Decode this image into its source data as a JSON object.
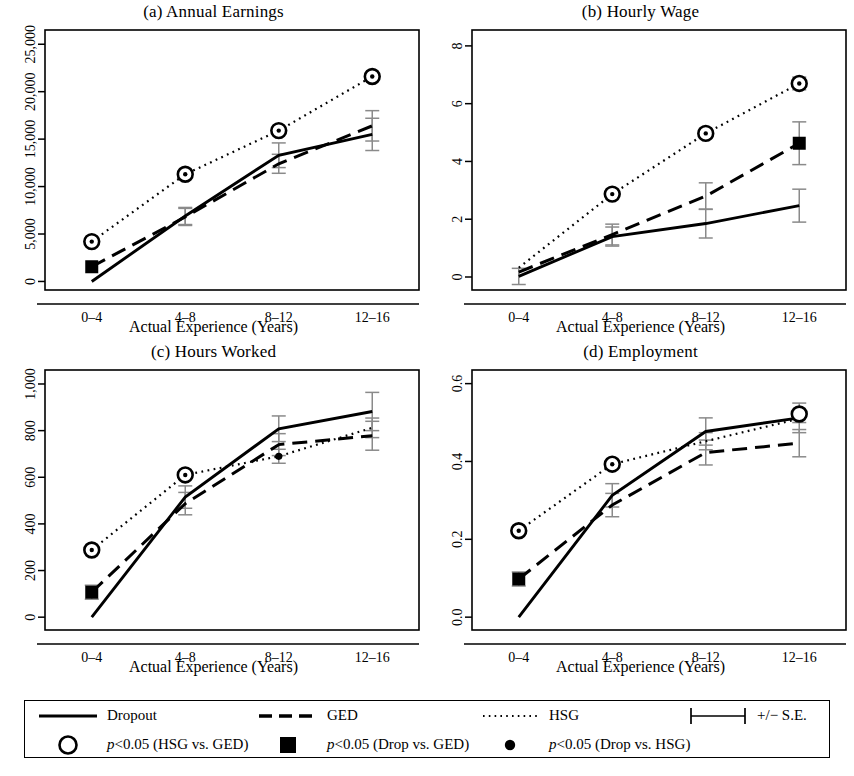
{
  "figure": {
    "xlabel": "Actual Experience (Years)",
    "categories": [
      "0–4",
      "4–8",
      "8–12",
      "12–16"
    ]
  },
  "legend": {
    "dropout_label": "Dropout",
    "ged_label": "GED",
    "hsg_label": "HSG",
    "se_label": "+/− S.E.",
    "p_hsg_ged_label": "<0.05 (HSG vs. GED)",
    "p_drop_ged_label": "<0.05 (Drop vs. GED)",
    "p_drop_hsg_label": "<0.05 (Drop vs. HSG)",
    "p_italic": "p",
    "sym_dropout": "solid-line-icon",
    "sym_ged": "dashed-line-icon",
    "sym_hsg": "dotted-line-icon",
    "sym_se": "error-bar-icon",
    "sym_open_circle": "open-circle-icon",
    "sym_filled_square": "filled-square-icon",
    "sym_small_dot": "small-dot-icon"
  },
  "chart_data": [
    {
      "id": "a",
      "type": "line",
      "title": "(a) Annual Earnings",
      "xlabel": "Actual Experience (Years)",
      "ylabel": "",
      "categories": [
        "0–4",
        "4–8",
        "8–12",
        "12–16"
      ],
      "yticks": [
        0,
        5000,
        10000,
        15000,
        20000,
        25000
      ],
      "ytick_labels": [
        "0",
        "5,000",
        "10,000",
        "15,000",
        "20,000",
        "25,000"
      ],
      "ylim": [
        -900,
        26500
      ],
      "grid": false,
      "series": [
        {
          "name": "Dropout",
          "style": "solid",
          "values": [
            0,
            6900,
            13300,
            15500
          ],
          "errors": [
            0,
            900,
            1300,
            1700
          ]
        },
        {
          "name": "GED",
          "style": "dashed",
          "values": [
            1550,
            6800,
            12400,
            16400
          ],
          "errors": [
            0,
            900,
            1000,
            1600
          ]
        },
        {
          "name": "HSG",
          "style": "dotted",
          "values": [
            4200,
            11300,
            15900,
            21600
          ],
          "errors": [
            0,
            0,
            0,
            0
          ]
        }
      ],
      "markers": [
        {
          "category": "0–4",
          "value": 4200,
          "symbol": "circle-dot",
          "meaning": "p<0.05 (HSG vs. GED)"
        },
        {
          "category": "4–8",
          "value": 11300,
          "symbol": "circle-dot",
          "meaning": "p<0.05 (HSG vs. GED)"
        },
        {
          "category": "8–12",
          "value": 15900,
          "symbol": "circle-dot",
          "meaning": "p<0.05 (HSG vs. GED)"
        },
        {
          "category": "12–16",
          "value": 21600,
          "symbol": "circle-dot",
          "meaning": "p<0.05 (HSG vs. GED)"
        },
        {
          "category": "0–4",
          "value": 1550,
          "symbol": "filled-square",
          "meaning": "p<0.05 (Drop vs. GED)"
        }
      ]
    },
    {
      "id": "b",
      "type": "line",
      "title": "(b) Hourly Wage",
      "xlabel": "Actual Experience (Years)",
      "ylabel": "",
      "categories": [
        "0–4",
        "4–8",
        "8–12",
        "12–16"
      ],
      "yticks": [
        0,
        2,
        4,
        6,
        8
      ],
      "ytick_labels": [
        "0",
        "2",
        "4",
        "6",
        "8"
      ],
      "ylim": [
        -0.45,
        8.55
      ],
      "grid": false,
      "series": [
        {
          "name": "Dropout",
          "style": "solid",
          "values": [
            0.02,
            1.4,
            1.85,
            2.47
          ],
          "errors": [
            0.28,
            0.33,
            0.5,
            0.57
          ]
        },
        {
          "name": "GED",
          "style": "dashed",
          "values": [
            0.17,
            1.47,
            2.8,
            4.63
          ],
          "errors": [
            0.0,
            0.36,
            0.46,
            0.74
          ]
        },
        {
          "name": "HSG",
          "style": "dotted",
          "values": [
            0.32,
            2.87,
            4.97,
            6.7
          ],
          "errors": [
            0.0,
            0.17,
            0.17,
            0.22
          ]
        }
      ],
      "markers": [
        {
          "category": "4–8",
          "value": 2.87,
          "symbol": "circle-dot",
          "meaning": "p<0.05 (HSG vs. GED)"
        },
        {
          "category": "8–12",
          "value": 4.97,
          "symbol": "circle-dot",
          "meaning": "p<0.05 (HSG vs. GED)"
        },
        {
          "category": "12–16",
          "value": 6.7,
          "symbol": "circle-dot",
          "meaning": "p<0.05 (HSG vs. GED)"
        },
        {
          "category": "12–16",
          "value": 4.63,
          "symbol": "filled-square",
          "meaning": "p<0.05 (Drop vs. GED)"
        }
      ]
    },
    {
      "id": "c",
      "type": "line",
      "title": "(c) Hours Worked",
      "xlabel": "Actual Experience (Years)",
      "ylabel": "",
      "categories": [
        "0–4",
        "4–8",
        "8–12",
        "12–16"
      ],
      "yticks": [
        0,
        200,
        400,
        600,
        800,
        1000
      ],
      "ytick_labels": [
        "0",
        "200",
        "400",
        "600",
        "800",
        "1,000"
      ],
      "ylim": [
        -55,
        1060
      ],
      "grid": false,
      "series": [
        {
          "name": "Dropout",
          "style": "solid",
          "values": [
            0,
            515,
            808,
            882
          ],
          "errors": [
            0,
            48,
            55,
            82
          ]
        },
        {
          "name": "GED",
          "style": "dashed",
          "values": [
            107,
            487,
            740,
            778
          ],
          "errors": [
            30,
            48,
            47,
            62
          ]
        },
        {
          "name": "HSG",
          "style": "dotted",
          "values": [
            288,
            610,
            690,
            812
          ],
          "errors": [
            14,
            16,
            30,
            42
          ]
        }
      ],
      "markers": [
        {
          "category": "0–4",
          "value": 288,
          "symbol": "circle-dot",
          "meaning": "p<0.05 (HSG vs. GED)"
        },
        {
          "category": "4–8",
          "value": 610,
          "symbol": "circle-dot",
          "meaning": "p<0.05 (HSG vs. GED)"
        },
        {
          "category": "0–4",
          "value": 107,
          "symbol": "filled-square",
          "meaning": "p<0.05 (Drop vs. GED)"
        },
        {
          "category": "8–12",
          "value": 690,
          "symbol": "small-dot",
          "meaning": "p<0.05 (Drop vs. HSG)"
        }
      ]
    },
    {
      "id": "d",
      "type": "line",
      "title": "(d) Employment",
      "xlabel": "Actual Experience (Years)",
      "ylabel": "",
      "categories": [
        "0–4",
        "4–8",
        "8–12",
        "12–16"
      ],
      "yticks": [
        0.0,
        0.2,
        0.4,
        0.6
      ],
      "ytick_labels": [
        "0.0",
        "0.2",
        "0.4",
        "0.6"
      ],
      "ylim": [
        -0.033,
        0.635
      ],
      "grid": false,
      "series": [
        {
          "name": "Dropout",
          "style": "solid",
          "values": [
            0.0,
            0.313,
            0.477,
            0.512
          ],
          "errors": [
            0.0,
            0.03,
            0.035,
            0.038
          ]
        },
        {
          "name": "GED",
          "style": "dashed",
          "values": [
            0.098,
            0.288,
            0.423,
            0.447
          ],
          "errors": [
            0.018,
            0.03,
            0.032,
            0.035
          ]
        },
        {
          "name": "HSG",
          "style": "dotted",
          "values": [
            0.222,
            0.393,
            0.452,
            0.51
          ],
          "errors": [
            0.01,
            0.01,
            0.022,
            0.01
          ]
        }
      ],
      "markers": [
        {
          "category": "0–4",
          "value": 0.222,
          "symbol": "circle-dot",
          "meaning": "p<0.05 (HSG vs. GED)"
        },
        {
          "category": "4–8",
          "value": 0.393,
          "symbol": "circle-dot",
          "meaning": "p<0.05 (HSG vs. GED)"
        },
        {
          "category": "0–4",
          "value": 0.098,
          "symbol": "filled-square",
          "meaning": "p<0.05 (Drop vs. GED)"
        },
        {
          "category": "12–16",
          "value": 0.522,
          "symbol": "open-circle",
          "meaning": "p<0.05 (HSG vs. GED)"
        }
      ]
    }
  ]
}
